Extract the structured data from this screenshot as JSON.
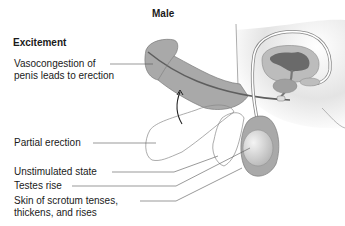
{
  "diagram": {
    "title": "Male",
    "phase": "Excitement",
    "labels": [
      {
        "line1": "Vasocongestion of",
        "line2": "penis leads to erection"
      },
      {
        "line1": "Partial erection"
      },
      {
        "line1": "Unstimulated state"
      },
      {
        "line1": "Testes rise"
      },
      {
        "line1": "Skin of scrotum tenses,",
        "line2": "thickens, and rises"
      }
    ]
  },
  "colors": {
    "tissue": "#a8a8a8",
    "tissue_light": "#c8c8c8",
    "dark_organ": "#6e6e6e",
    "outline": "#7a7a7a",
    "leader": "#555555",
    "text": "#1a1a1a"
  }
}
